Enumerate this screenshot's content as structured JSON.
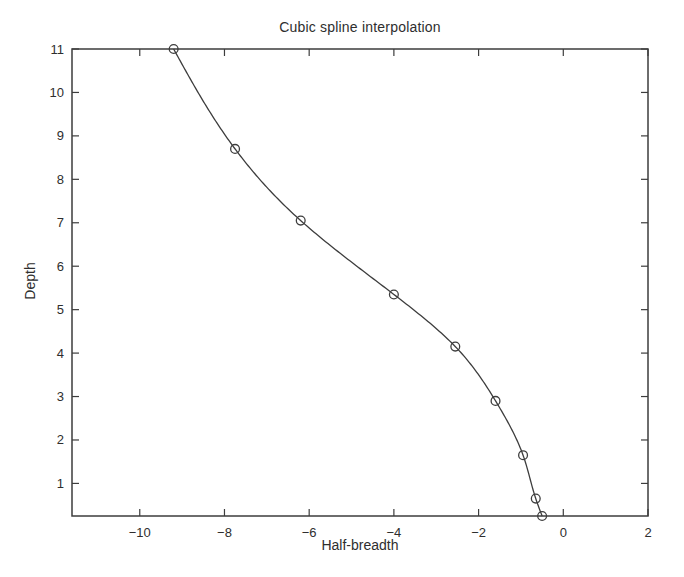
{
  "figure": {
    "background": "#ffffff"
  },
  "chart_data": {
    "type": "line",
    "title": "Cubic spline interpolation",
    "xlabel": "Half-breadth",
    "ylabel": "Depth",
    "xlim": [
      -11.6,
      2
    ],
    "ylim": [
      0.25,
      11
    ],
    "xticks": [
      -10,
      -8,
      -6,
      -4,
      -2,
      0,
      2
    ],
    "xtick_labels": [
      "−10",
      "−8",
      "−6",
      "−4",
      "−2",
      "0",
      "2"
    ],
    "yticks": [
      1,
      2,
      3,
      4,
      5,
      6,
      7,
      8,
      9,
      10,
      11
    ],
    "ytick_labels": [
      "1",
      "2",
      "3",
      "4",
      "5",
      "6",
      "7",
      "8",
      "9",
      "10",
      "11"
    ],
    "grid": false,
    "legend": "none",
    "line_style": "solid",
    "marker": "open-circle",
    "stroke_color": "#3d3d3d",
    "text_color": "#2e2e2e",
    "series": [
      {
        "name": "cubic spline through data points",
        "x": [
          -9.2,
          -7.75,
          -6.2,
          -4.0,
          -2.55,
          -1.6,
          -0.95,
          -0.65,
          -0.5
        ],
        "y": [
          11.0,
          8.7,
          7.05,
          5.35,
          4.15,
          2.9,
          1.65,
          0.65,
          0.25
        ]
      }
    ]
  }
}
